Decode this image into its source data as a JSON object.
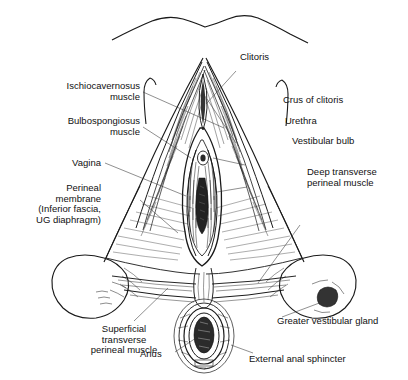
{
  "figure": {
    "background": "#ffffff",
    "ink_color": "#1a1a1a",
    "leader_color": "#333333"
  },
  "labels": {
    "clitoris": "Clitoris",
    "ischiocavernosus": "Ischiocavernosus\nmuscle",
    "bulbospongiosus": "Bulbospongiosus\nmuscle",
    "vagina": "Vagina",
    "perineal_membrane": "Perineal\nmembrane\n(Inferior fascia,\nUG diaphragm)",
    "superficial_transverse": "Superficial\ntransverse\nperineal muscle",
    "anus": "Anus",
    "crus_of_clitoris": "Crus of clitoris",
    "urethra": "Urethra",
    "vestibular_bulb": "Vestibular bulb",
    "deep_transverse": "Deep transverse\nperineal muscle",
    "greater_vestibular_gland": "Greater vestibular gland",
    "external_anal_sphincter": "External anal sphincter"
  },
  "structures": [
    "mons-pubis-contour",
    "retractor-hook-left",
    "retractor-hook-right",
    "ischiocavernosus-muscle-left",
    "ischiocavernosus-muscle-right",
    "bulbospongiosus-muscle-left",
    "bulbospongiosus-muscle-right",
    "vaginal-orifice",
    "urethral-orifice",
    "perineal-membrane-sheet",
    "deep-transverse-perineal-muscle",
    "superficial-transverse-perineal-muscle",
    "perineal-body",
    "anal-canal",
    "external-anal-sphincter-rings",
    "labium-majus-fat-pad-left",
    "labium-majus-fat-pad-right",
    "greater-vestibular-gland"
  ]
}
